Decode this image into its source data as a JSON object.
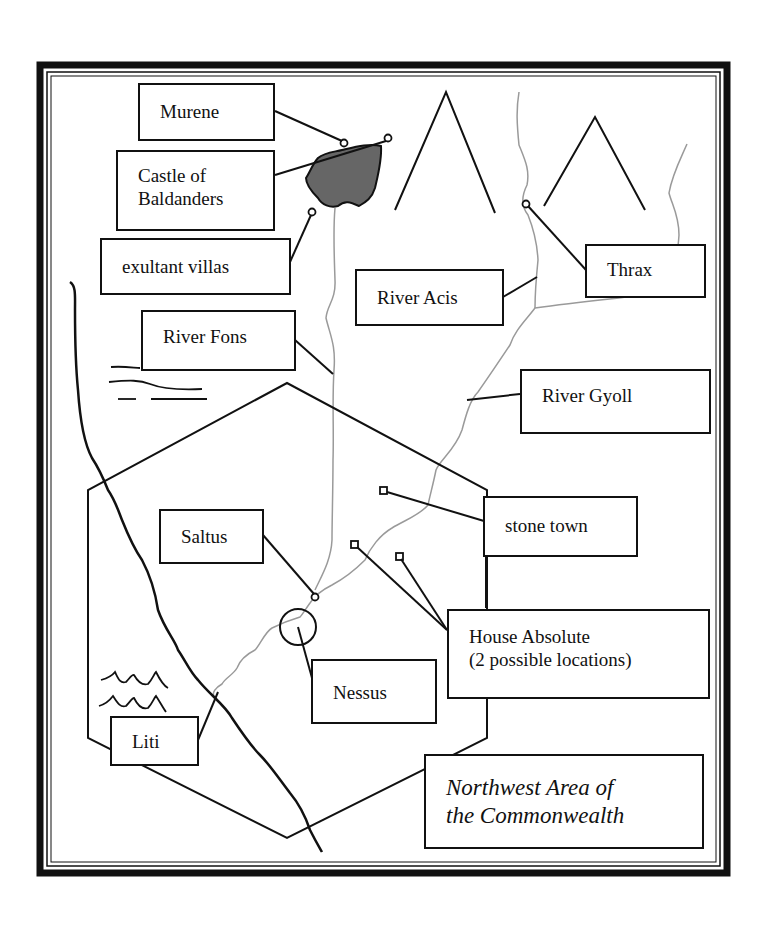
{
  "map": {
    "title_line1": "Northwest Area of",
    "title_line2": "the Commonwealth",
    "labels": {
      "murene": "Murene",
      "castle_line1": "Castle of",
      "castle_line2": "Baldanders",
      "exultant_villas": "exultant villas",
      "river_fons": "River Fons",
      "river_acis": "River Acis",
      "thrax": "Thrax",
      "river_gyoll": "River Gyoll",
      "stone_town": "stone town",
      "saltus": "Saltus",
      "house_absolute_line1": "House Absolute",
      "house_absolute_line2": "(2 possible locations)",
      "nessus": "Nessus",
      "liti": "Liti"
    },
    "colors": {
      "ink": "#111111",
      "river": "#9a9a9a",
      "lake_fill": "#666666",
      "background": "#ffffff"
    }
  }
}
